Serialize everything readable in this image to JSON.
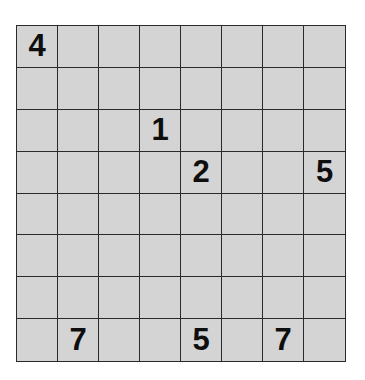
{
  "puzzle": {
    "rows": 8,
    "cols": 8,
    "colors": {
      "cell_bg": "#d4d4d4",
      "grid_line": "#2a2a2a",
      "digit": "#0e0e0e"
    },
    "grid": [
      [
        "4",
        "",
        "",
        "",
        "",
        "",
        "",
        ""
      ],
      [
        "",
        "",
        "",
        "",
        "",
        "",
        "",
        ""
      ],
      [
        "",
        "",
        "",
        "1",
        "",
        "",
        "",
        ""
      ],
      [
        "",
        "",
        "",
        "",
        "2",
        "",
        "",
        "5"
      ],
      [
        "",
        "",
        "",
        "",
        "",
        "",
        "",
        ""
      ],
      [
        "",
        "",
        "",
        "",
        "",
        "",
        "",
        ""
      ],
      [
        "",
        "",
        "",
        "",
        "",
        "",
        "",
        ""
      ],
      [
        "",
        "7",
        "",
        "",
        "5",
        "",
        "7",
        ""
      ]
    ]
  }
}
